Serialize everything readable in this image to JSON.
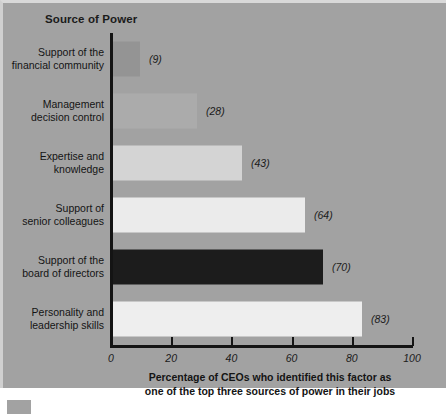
{
  "chart_data": {
    "type": "bar",
    "orientation": "horizontal",
    "title": "Source of Power",
    "xlabel": "Percentage of CEOs who identified this factor as one of the top three sources of power in their jobs",
    "ylabel": "Source of Power",
    "xlim": [
      0,
      100
    ],
    "grid": false,
    "legend": null,
    "tick_labels": [
      "0",
      "20",
      "40",
      "60",
      "80",
      "100"
    ],
    "ticks": [
      0,
      20,
      40,
      60,
      80,
      100
    ],
    "categories": [
      "Support of the financial community",
      "Management decision control",
      "Expertise and knowledge",
      "Support of senior colleagues",
      "Support of the board of directors",
      "Personality and leadership skills"
    ],
    "values": [
      9,
      28,
      43,
      64,
      70,
      83
    ],
    "value_labels": [
      "(9)",
      "(28)",
      "(43)",
      "(64)",
      "(70)",
      "(83)"
    ],
    "bar_colors": [
      "#949494",
      "#ababab",
      "#d4d4d4",
      "#ebebeb",
      "#1c1c1c",
      "#eeeeee"
    ],
    "background_color": "#a2a2a2",
    "axis_color": "#141414"
  },
  "caption": {
    "line1": "Percentage of CEOs who identified this factor as",
    "line2": "one of the top three sources of power in their jobs"
  },
  "bars": [
    {
      "label_line1": "Support of the",
      "label_line2": "financial community",
      "value": "(9)"
    },
    {
      "label_line1": "Management",
      "label_line2": "decision control",
      "value": "(28)"
    },
    {
      "label_line1": "Expertise and",
      "label_line2": "knowledge",
      "value": "(43)"
    },
    {
      "label_line1": "Support of",
      "label_line2": "senior colleagues",
      "value": "(64)"
    },
    {
      "label_line1": "Support of the",
      "label_line2": "board of directors",
      "value": "(70)"
    },
    {
      "label_line1": "Personality and",
      "label_line2": "leadership skills",
      "value": "(83)"
    }
  ]
}
